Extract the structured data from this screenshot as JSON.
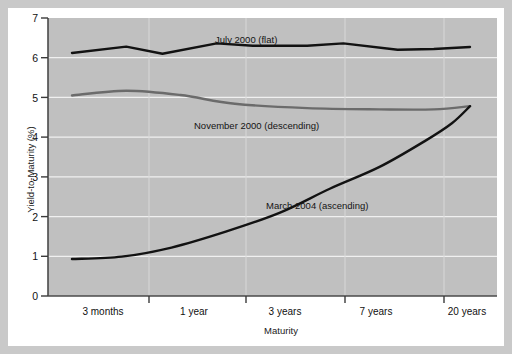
{
  "chart_data": {
    "type": "line",
    "title": "",
    "xlabel": "Maturity",
    "ylabel": "Yield-to-Maturity (%)",
    "categories": [
      "3 months",
      "1 year",
      "3 years",
      "7 years",
      "20 years"
    ],
    "x_tick_labels": [
      "3 months",
      "1 year",
      "3 years",
      "7 years",
      "20 years"
    ],
    "y_tick_labels": [
      "0",
      "1",
      "2",
      "3",
      "4",
      "5",
      "6",
      "7"
    ],
    "ylim": [
      0,
      7
    ],
    "grid": true,
    "legend_position": "inline-annotations",
    "series": [
      {
        "name": "July 2000 (flat)",
        "color": "#121212",
        "annotation": "July 2000 (flat)",
        "x": [
          0.0,
          0.6,
          1.0,
          1.6,
          2.0,
          2.6,
          3.0,
          3.6,
          4.0,
          4.4
        ],
        "values": [
          6.12,
          6.28,
          6.1,
          6.36,
          6.3,
          6.3,
          6.36,
          6.2,
          6.22,
          6.27
        ]
      },
      {
        "name": "November 2000 (descending)",
        "color": "#6b6b6b",
        "annotation": "November 2000 (descending)",
        "x": [
          0.0,
          0.6,
          1.2,
          1.8,
          2.6,
          3.4,
          4.0,
          4.4
        ],
        "values": [
          5.05,
          5.17,
          5.06,
          4.84,
          4.73,
          4.7,
          4.7,
          4.78
        ]
      },
      {
        "name": "March 2004 (ascending)",
        "color": "#121212",
        "annotation": "March 2004 (ascending)",
        "x": [
          0.0,
          0.55,
          1.1,
          1.7,
          2.3,
          2.85,
          3.4,
          3.9,
          4.2,
          4.4
        ],
        "values": [
          0.93,
          0.99,
          1.22,
          1.62,
          2.1,
          2.7,
          3.25,
          3.9,
          4.35,
          4.78
        ]
      }
    ]
  },
  "annotations": {
    "july": "July 2000 (flat)",
    "november": "November 2000 (descending)",
    "march": "March 2004 (ascending)"
  },
  "colors": {
    "plot_background": "#c0c0c0",
    "gridline": "#f0f0f0",
    "axis": "#5a5a5a",
    "flat_series": "#121212",
    "descending_series": "#6b6b6b",
    "ascending_series": "#121212",
    "card_background": "#ffffff",
    "page_background": "#c9c9c9"
  }
}
